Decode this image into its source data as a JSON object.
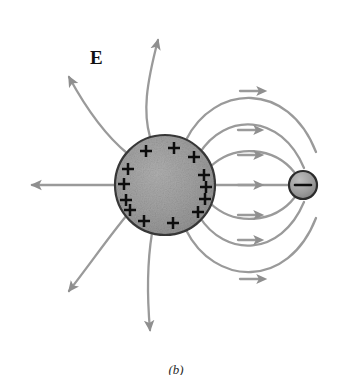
{
  "figure": {
    "caption": "(b)",
    "field_label": "E",
    "background_color": "#ffffff"
  },
  "colors": {
    "field_line": "#9a9a9a",
    "field_line_dark": "#8a8a8a",
    "sphere_fill": "#9e9e9e",
    "sphere_stroke": "#3a3a3a",
    "small_sphere_fill": "#9a9a9a",
    "small_sphere_stroke": "#2b2b2b",
    "charge_symbol": "#0d0d0d",
    "label_color": "#111111"
  },
  "positive_sphere": {
    "name": "positively-charged-conducting-sphere",
    "center_x": 165,
    "center_y": 185,
    "radius": 50,
    "charge_sign": "+",
    "charge_count": 13,
    "charge_positions": [
      {
        "x": 146,
        "y": 151
      },
      {
        "x": 174,
        "y": 148
      },
      {
        "x": 194,
        "y": 157
      },
      {
        "x": 128,
        "y": 169
      },
      {
        "x": 124,
        "y": 184
      },
      {
        "x": 126,
        "y": 200
      },
      {
        "x": 204,
        "y": 175
      },
      {
        "x": 206,
        "y": 187
      },
      {
        "x": 205,
        "y": 199
      },
      {
        "x": 198,
        "y": 212
      },
      {
        "x": 144,
        "y": 221
      },
      {
        "x": 173,
        "y": 223
      },
      {
        "x": 130,
        "y": 210
      }
    ]
  },
  "negative_charge": {
    "name": "negative-point-charge",
    "center_x": 303,
    "center_y": 185,
    "radius": 14,
    "charge_sign": "−"
  },
  "field_lines": {
    "description": "Electric field lines directed outward from the positive sphere; lines on the right terminate on the negative charge.",
    "outward_count": 5,
    "inward_count": 7,
    "arrow_direction_outward": "away-from-sphere",
    "arrow_direction_inward": "toward-negative-charge"
  }
}
